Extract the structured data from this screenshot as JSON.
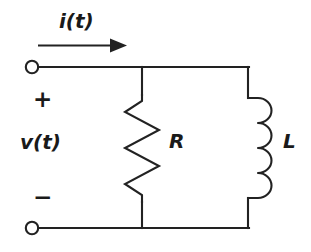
{
  "figure": {
    "background_color": "#ffffff",
    "line_color": "#222222"
  },
  "labels": {
    "current": "i(t)",
    "voltage": "v(t)",
    "resistor": "R",
    "inductor": "L",
    "polarity_plus": "+",
    "polarity_minus": "−"
  },
  "components": [
    {
      "name": "resistor",
      "symbol": "zigzag",
      "label": "R"
    },
    {
      "name": "inductor",
      "symbol": "coil",
      "label": "L"
    }
  ],
  "terminals": [
    {
      "name": "top-terminal",
      "polarity": "+"
    },
    {
      "name": "bottom-terminal",
      "polarity": "−"
    }
  ],
  "annotations": {
    "current_direction": "right"
  }
}
